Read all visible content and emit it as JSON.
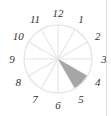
{
  "diagram": {
    "type": "clock-sector",
    "center": [
      58,
      59
    ],
    "radius": 34,
    "segments": 12,
    "labels": [
      "12",
      "1",
      "2",
      "3",
      "4",
      "5",
      "6",
      "7",
      "8",
      "9",
      "10",
      "11"
    ],
    "shaded_sector": {
      "from_hour": 4,
      "to_hour": 5,
      "color": "#a6a6a6"
    },
    "line_color": "#e6e6e6"
  }
}
